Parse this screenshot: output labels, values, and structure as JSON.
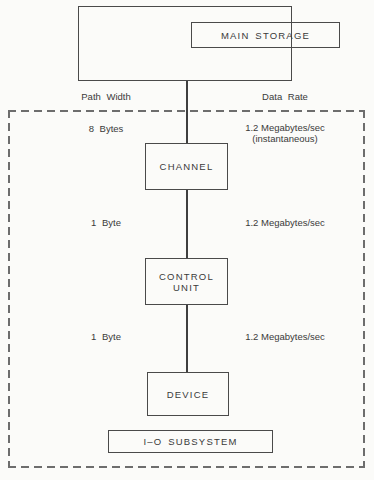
{
  "diagram": {
    "main_storage": {
      "label": "MAIN STORAGE"
    },
    "column_headers": {
      "left": "Path Width",
      "right": "Data Rate"
    },
    "rows": [
      {
        "path_width": "8 Bytes",
        "data_rate": "1.2 Megabytes/sec",
        "data_rate_note": "(instantaneous)",
        "box_label": "CHANNEL"
      },
      {
        "path_width": "1 Byte",
        "data_rate": "1.2 Megabytes/sec",
        "box_label": "CONTROL UNIT"
      },
      {
        "path_width": "1 Byte",
        "data_rate": "1.2 Megabytes/sec",
        "box_label": "DEVICE"
      }
    ],
    "io_subsystem": {
      "label": "I–O SUBSYSTEM"
    },
    "colors": {
      "solid_line": "#4a4a4a",
      "dashed_line": "#6d6d6d",
      "text": "#3a3a3a",
      "background": "#fbfbf9"
    }
  }
}
